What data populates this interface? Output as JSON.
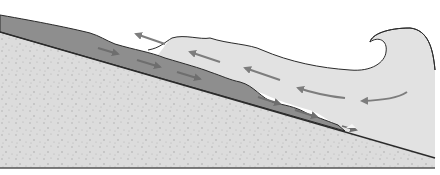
{
  "diagram": {
    "title": "",
    "colors": {
      "background": "#ffffff",
      "sand": "#dcdcdc",
      "sand_dots": "#a8a8a8",
      "sediment_layer": "#8e8e8e",
      "water": "#e2e2e2",
      "outline": "#2a2a2a",
      "arrow_water": "#7d7d7d",
      "arrow_sediment": "#6e6e6e",
      "baseline": "#555555"
    },
    "elements": [
      {
        "name": "sand-body",
        "label": ""
      },
      {
        "name": "sediment-layer",
        "label": ""
      },
      {
        "name": "wave-water",
        "label": ""
      },
      {
        "name": "wave-crest",
        "label": ""
      }
    ],
    "arrows": {
      "water_count": 5,
      "sediment_count": 5
    }
  }
}
